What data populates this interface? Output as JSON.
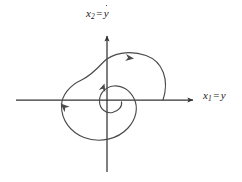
{
  "figure": {
    "kind": "phase-plane-diagram",
    "background_color": "#ffffff",
    "stroke_color": "#4a4a4a",
    "axis_color": "#333333",
    "label_color": "#1a1a1a"
  },
  "axes": {
    "vertical": {
      "label_var": "x",
      "label_sub": "2",
      "label_eq": "=",
      "label_rhs": "y",
      "label_rhs_dot": true,
      "label_full": "x₂ = ẏ",
      "arrow_direction": "up"
    },
    "horizontal": {
      "label_var": "x",
      "label_sub": "1",
      "label_eq": "=",
      "label_rhs": "y",
      "label_rhs_dot": false,
      "label_full": "x₁ = y",
      "arrow_direction": "right"
    }
  },
  "chart_data": {
    "type": "line",
    "title": "",
    "xlabel": "x1 = y",
    "ylabel": "x2 = ydot",
    "grid": false,
    "legend": null,
    "origin_px": [
      107,
      100
    ],
    "xlim_px": [
      16,
      199
    ],
    "ylim_px": [
      30,
      172
    ],
    "series": [
      {
        "name": "spiral-trajectory",
        "description": "inward spiral orbit about the origin",
        "direction": "counterclockwise-inward",
        "stroke": "#4a4a4a",
        "path": "M 163 100 C 169 80 163 62 146 56 C 129 50 112 54 104 62 C 96 70 90 76 82 80 C 70 86 62 96 62 106 C 62 120 70 132 84 137 C 100 143 118 139 128 128 C 136 119 138 108 134 99 C 130 90 122 85 114 86 C 106 87 100 93 100 101 C 100 109 106 114 113 113 C 119 112 123 107 122 102"
      }
    ],
    "arrows": [
      {
        "name": "arrow-outer-top",
        "position_px": [
          130,
          59
        ],
        "direction": "right",
        "angle_deg": 8
      },
      {
        "name": "arrow-inner-top",
        "position_px": [
          106,
          85
        ],
        "direction": "up",
        "angle_deg": -80
      },
      {
        "name": "arrow-lower-left",
        "position_px": [
          65,
          106
        ],
        "direction": "down-left",
        "angle_deg": 218
      }
    ]
  }
}
